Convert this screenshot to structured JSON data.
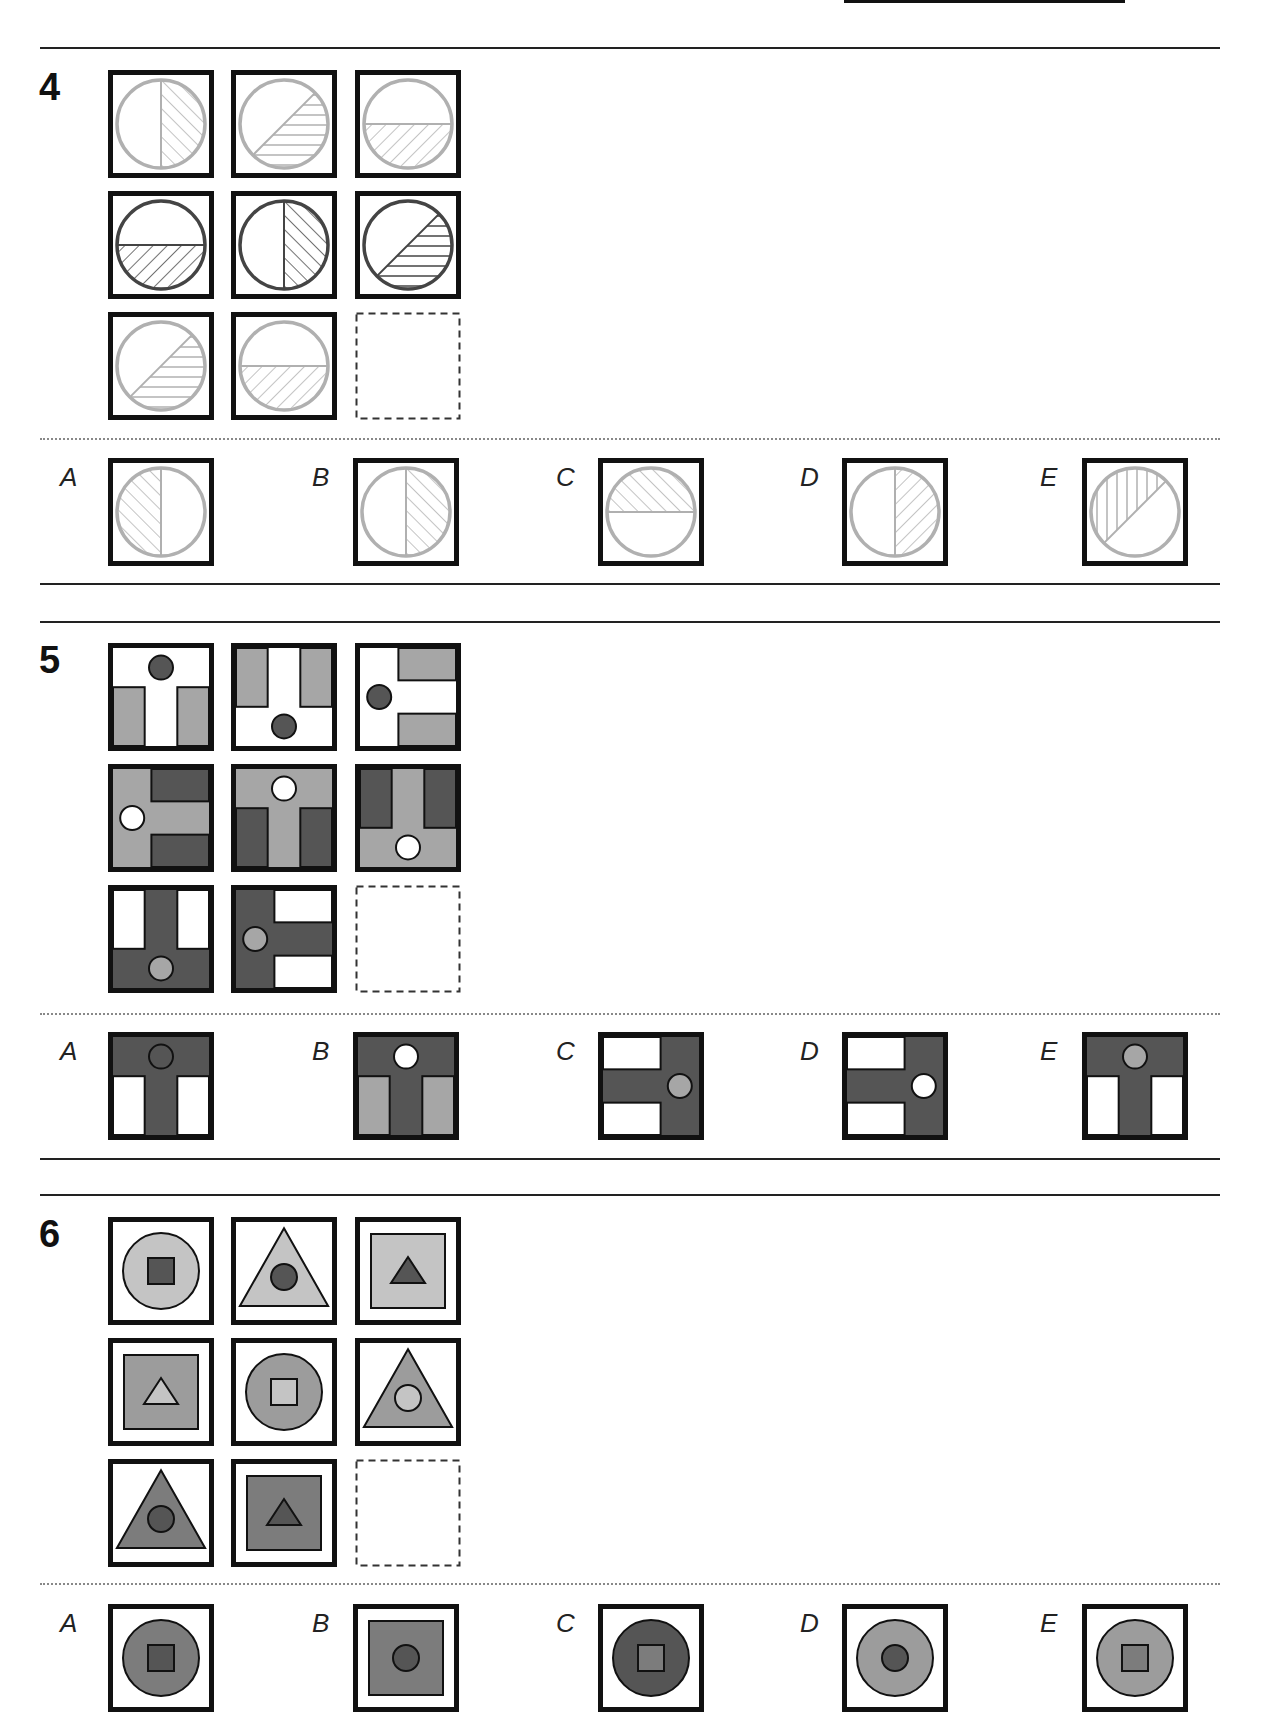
{
  "colors": {
    "frame": "#111111",
    "light_hatch": "#b0b0b0",
    "dark_hatch": "#444444",
    "s5_gray": "#a6a6a6",
    "s5_dark": "#555555",
    "s6_light": "#c4c4c4",
    "s6_mid": "#9c9c9c",
    "s6_darkmid": "#7c7c7c",
    "s6_dark": "#555555"
  },
  "questions": [
    {
      "number": "4",
      "top_line_y": 47,
      "grid_top": 70,
      "dot_y": 438,
      "opt_top": 458,
      "bottom_line_y": 583,
      "type": "hatch",
      "grid": [
        {
          "tone": "light",
          "region": "right",
          "hatch": "fwd"
        },
        {
          "tone": "light",
          "region": "diag",
          "hatch": "horiz"
        },
        {
          "tone": "light",
          "region": "bottom",
          "hatch": "back"
        },
        {
          "tone": "dark",
          "region": "bottom",
          "hatch": "back"
        },
        {
          "tone": "dark",
          "region": "right",
          "hatch": "fwd"
        },
        {
          "tone": "dark",
          "region": "diag",
          "hatch": "horiz"
        },
        {
          "tone": "light",
          "region": "diag",
          "hatch": "horiz"
        },
        {
          "tone": "light",
          "region": "bottom",
          "hatch": "back"
        },
        {
          "empty": true
        }
      ],
      "options": [
        {
          "label": "A",
          "tone": "light",
          "region": "left",
          "hatch": "fwd"
        },
        {
          "label": "B",
          "tone": "light",
          "region": "right",
          "hatch": "fwd"
        },
        {
          "label": "C",
          "tone": "light",
          "region": "top",
          "hatch": "fwd"
        },
        {
          "label": "D",
          "tone": "light",
          "region": "right",
          "hatch": "back"
        },
        {
          "label": "E",
          "tone": "light",
          "region": "diagul",
          "hatch": "vert"
        }
      ]
    },
    {
      "number": "5",
      "top_line_y": 621,
      "grid_top": 643,
      "dot_y": 1013,
      "opt_top": 1032,
      "bottom_line_y": 1158,
      "type": "tshape",
      "grid": [
        {
          "orient": "up",
          "bg": "white",
          "t": "white",
          "side": "gray",
          "dot": "dark"
        },
        {
          "orient": "down",
          "bg": "white",
          "t": "white",
          "side": "gray",
          "dot": "dark"
        },
        {
          "orient": "left",
          "bg": "white",
          "t": "white",
          "side": "gray",
          "dot": "dark"
        },
        {
          "orient": "left",
          "t": "gray",
          "side": "dark",
          "dot": "white"
        },
        {
          "orient": "up",
          "t": "gray",
          "side": "dark",
          "dot": "white"
        },
        {
          "orient": "down",
          "t": "gray",
          "side": "dark",
          "dot": "white"
        },
        {
          "orient": "down",
          "t": "dark",
          "side": "white",
          "dot": "gray"
        },
        {
          "orient": "left",
          "t": "dark",
          "side": "white",
          "dot": "gray"
        },
        {
          "empty": true
        }
      ],
      "options": [
        {
          "label": "A",
          "orient": "up",
          "t": "dark",
          "side": "white",
          "dot": "dark"
        },
        {
          "label": "B",
          "orient": "up",
          "t": "dark",
          "side": "gray",
          "dot": "white"
        },
        {
          "label": "C",
          "orient": "right",
          "t": "dark",
          "side": "white",
          "dot": "gray"
        },
        {
          "label": "D",
          "orient": "right",
          "t": "dark",
          "side": "white",
          "dot": "white"
        },
        {
          "label": "E",
          "orient": "up",
          "t": "dark",
          "side": "white",
          "dot": "gray"
        }
      ]
    },
    {
      "number": "6",
      "top_line_y": 1194,
      "grid_top": 1217,
      "dot_y": 1583,
      "opt_top": 1604,
      "bottom_line_y": null,
      "type": "nested",
      "grid": [
        {
          "outer": "circle",
          "outerFill": "light",
          "inner": "square",
          "innerFill": "dark"
        },
        {
          "outer": "triangle",
          "outerFill": "light",
          "inner": "circle",
          "innerFill": "dark"
        },
        {
          "outer": "square",
          "outerFill": "light",
          "inner": "triangle",
          "innerFill": "dark"
        },
        {
          "outer": "square",
          "outerFill": "mid",
          "inner": "triangle",
          "innerFill": "light"
        },
        {
          "outer": "circle",
          "outerFill": "mid",
          "inner": "square",
          "innerFill": "light"
        },
        {
          "outer": "triangle",
          "outerFill": "mid",
          "inner": "circle",
          "innerFill": "light"
        },
        {
          "outer": "triangle",
          "outerFill": "darkmid",
          "inner": "circle",
          "innerFill": "dark"
        },
        {
          "outer": "square",
          "outerFill": "darkmid",
          "inner": "triangle",
          "innerFill": "dark"
        },
        {
          "empty": true
        }
      ],
      "options": [
        {
          "label": "A",
          "outer": "circle",
          "outerFill": "darkmid",
          "inner": "square",
          "innerFill": "dark"
        },
        {
          "label": "B",
          "outer": "square",
          "outerFill": "darkmid",
          "inner": "circle",
          "innerFill": "dark"
        },
        {
          "label": "C",
          "outer": "circle",
          "outerFill": "dark",
          "inner": "square",
          "innerFill": "darkmid"
        },
        {
          "label": "D",
          "outer": "circle",
          "outerFill": "mid",
          "inner": "circle",
          "innerFill": "dark"
        },
        {
          "label": "E",
          "outer": "circle",
          "outerFill": "mid",
          "inner": "square",
          "innerFill": "darkmid"
        }
      ]
    }
  ],
  "layout": {
    "grid_cols_x": [
      108,
      231,
      355
    ],
    "grid_row_pitch": 121,
    "option_box_x": [
      108,
      353,
      598,
      842,
      1082
    ],
    "option_label_x": [
      60,
      312,
      556,
      800,
      1040
    ]
  }
}
